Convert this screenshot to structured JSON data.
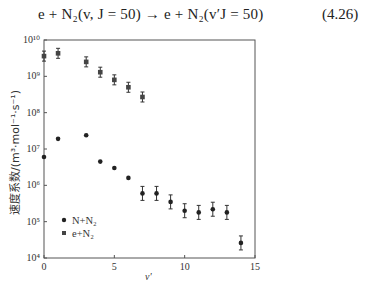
{
  "equation": {
    "text": "e + N₂(v, J = 50) → e + N₂(v′J = 50)",
    "number": "(4.26)"
  },
  "chart_data": {
    "type": "scatter",
    "title": "",
    "xlabel": "v'",
    "ylabel": "速度系数/(m³·mol⁻¹·s⁻¹)",
    "xlim": [
      0,
      15
    ],
    "ylim": [
      10000,
      10000000000
    ],
    "yscale": "log",
    "x_ticks": [
      "0",
      "5",
      "10",
      "15"
    ],
    "y_ticks": [
      "10^4",
      "10^5",
      "10^6",
      "10^7",
      "10^8",
      "10^9",
      "10^10"
    ],
    "legend_position": "lower left",
    "grid": false,
    "series": [
      {
        "name": "N+N2",
        "marker": "circle",
        "x": [
          0,
          1,
          3,
          4,
          5,
          6,
          7,
          8,
          9,
          10,
          11,
          12,
          13,
          14
        ],
        "values": [
          6000000,
          19000000,
          24000000,
          4500000,
          3000000,
          1600000,
          600000,
          600000,
          350000,
          200000,
          180000,
          220000,
          180000,
          26000
        ],
        "error_bars": [
          false,
          false,
          false,
          false,
          false,
          false,
          true,
          true,
          true,
          true,
          true,
          true,
          true,
          true
        ]
      },
      {
        "name": "e+N2",
        "marker": "square",
        "x": [
          0,
          1,
          3,
          4,
          5,
          6,
          7
        ],
        "values": [
          3600000000,
          4300000000,
          2500000000,
          1300000000,
          800000000,
          500000000,
          270000000
        ],
        "error_bars": [
          true,
          true,
          true,
          true,
          true,
          true,
          true
        ]
      }
    ]
  },
  "legend": {
    "items": [
      "N+N₂",
      "e+N₂"
    ]
  },
  "axes": {
    "xlabel": "v'",
    "ylabel": "速度系数/(m³·mol⁻¹·s⁻¹)",
    "x_ticks": [
      "0",
      "5",
      "10",
      "15"
    ],
    "y_ticks": [
      "10⁴",
      "10⁵",
      "10⁶",
      "10⁷",
      "10⁸",
      "10⁹",
      "10¹⁰"
    ]
  }
}
